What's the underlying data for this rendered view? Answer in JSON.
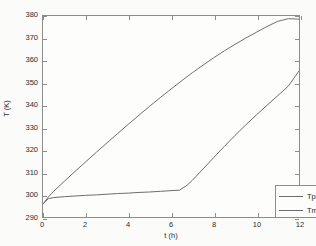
{
  "figure": {
    "background_color": "#fbfbfa",
    "axes_color": "#8c8c8c",
    "line_color": "#6e6e6e"
  },
  "chart_data": {
    "type": "line",
    "title": "",
    "xlabel": "t (h)",
    "ylabel": "T (K)",
    "xlim": [
      0,
      12
    ],
    "ylim": [
      290,
      380
    ],
    "xticks": [
      0,
      2,
      4,
      6,
      8,
      10,
      12
    ],
    "yticks": [
      290,
      300,
      310,
      320,
      330,
      340,
      350,
      360,
      370,
      380
    ],
    "grid": false,
    "legend_position": "lower right",
    "series": [
      {
        "name": "Tpv",
        "color": "#6e6e6e",
        "x": [
          0,
          0.25,
          0.5,
          1,
          1.5,
          2,
          2.5,
          3,
          3.5,
          4,
          4.5,
          5,
          5.5,
          6,
          6.5,
          7,
          7.5,
          8,
          8.5,
          9,
          9.5,
          10,
          10.5,
          11,
          11.5,
          12
        ],
        "y": [
          295.8,
          299.0,
          301.5,
          306.0,
          310.4,
          314.7,
          319.0,
          323.2,
          327.4,
          331.5,
          335.6,
          339.6,
          343.5,
          347.3,
          351.0,
          354.6,
          358.0,
          361.3,
          364.4,
          367.3,
          370.1,
          372.7,
          375.3,
          377.6,
          378.8,
          378.6
        ]
      },
      {
        "name": "Tmcp",
        "color": "#6e6e6e",
        "x": [
          0,
          0.25,
          0.5,
          1,
          1.5,
          2,
          2.5,
          3,
          3.5,
          4,
          4.5,
          5,
          5.5,
          6,
          6.4,
          6.75,
          7,
          7.5,
          8,
          8.5,
          9,
          9.5,
          10,
          10.5,
          11,
          11.5,
          12
        ],
        "y": [
          295.8,
          298.2,
          298.7,
          299.1,
          299.4,
          299.7,
          299.9,
          300.2,
          300.5,
          300.7,
          301.0,
          301.2,
          301.5,
          301.8,
          302.0,
          304.2,
          306.4,
          311.5,
          316.6,
          321.6,
          326.5,
          331.2,
          335.7,
          340.0,
          344.3,
          348.6,
          355.4
        ]
      }
    ]
  },
  "legend": {
    "entries": [
      {
        "label": "Tpv"
      },
      {
        "label": "Tmcp"
      }
    ]
  },
  "axes": {
    "y_tick_labels": [
      "380",
      "370",
      "360",
      "350",
      "340",
      "330",
      "320",
      "310",
      "300",
      "290"
    ],
    "x_tick_labels": [
      "0",
      "2",
      "4",
      "6",
      "8",
      "10",
      "12"
    ],
    "y_title": "T (K)",
    "x_title": "t (h)"
  }
}
